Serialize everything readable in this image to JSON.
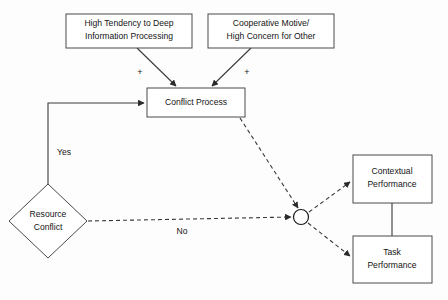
{
  "diagram": {
    "colors": {
      "background": "#fdfdfd",
      "node_fill": "#ffffff",
      "node_stroke": "#4a4a4a",
      "link_stroke": "#3a3a3a",
      "text": "#141414"
    },
    "nodes": {
      "deep_processing": {
        "shape": "rectangle",
        "line1": "High Tendency to Deep",
        "line2": "Information Processing",
        "x": 66,
        "y": 14,
        "w": 126,
        "h": 34
      },
      "cooperative_motive": {
        "shape": "rectangle",
        "line1": "Cooperative Motive/",
        "line2": "High Concern for Other",
        "x": 208,
        "y": 14,
        "w": 126,
        "h": 34
      },
      "conflict_process": {
        "shape": "rectangle",
        "line1": "Conflict Process",
        "line2": "",
        "x": 147,
        "y": 88,
        "w": 98,
        "h": 29
      },
      "resource_conflict": {
        "shape": "diamond",
        "line1": "Resource",
        "line2": "Conflict",
        "cx": 48,
        "cy": 221,
        "rx": 39,
        "ry": 37
      },
      "contextual_performance": {
        "shape": "rectangle",
        "line1": "Contextual",
        "line2": "Performance",
        "x": 353,
        "y": 155,
        "w": 79,
        "h": 48
      },
      "task_performance": {
        "shape": "rectangle",
        "line1": "Task",
        "line2": "Performance",
        "x": 353,
        "y": 236,
        "w": 79,
        "h": 47
      },
      "junction": {
        "shape": "circle",
        "cx": 301,
        "cy": 217,
        "r": 7.5
      }
    },
    "edge_labels": {
      "plus_left": "+",
      "plus_right": "+",
      "yes": "Yes",
      "no": "No"
    },
    "edges": [
      {
        "from": "deep_processing",
        "to": "conflict_process",
        "style": "solid",
        "label": "+"
      },
      {
        "from": "cooperative_motive",
        "to": "conflict_process",
        "style": "solid",
        "label": "+"
      },
      {
        "from": "resource_conflict",
        "to": "conflict_process",
        "style": "solid",
        "label": "Yes"
      },
      {
        "from": "resource_conflict",
        "to": "junction",
        "style": "dashed",
        "label": "No"
      },
      {
        "from": "conflict_process",
        "to": "junction",
        "style": "dashed",
        "label": ""
      },
      {
        "from": "junction",
        "to": "contextual_performance",
        "style": "dashed",
        "label": ""
      },
      {
        "from": "junction",
        "to": "task_performance",
        "style": "dashed",
        "label": ""
      },
      {
        "from": "contextual_performance",
        "to": "task_performance",
        "style": "solid",
        "label": ""
      }
    ]
  }
}
